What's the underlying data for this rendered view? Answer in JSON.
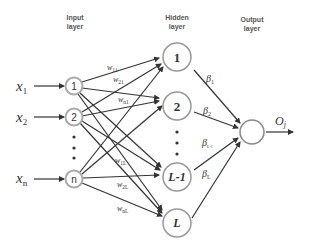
{
  "labels": {
    "input_layer": [
      "Input",
      "layer"
    ],
    "hidden_layer": [
      "Hidden",
      "layer"
    ],
    "output_layer": [
      "Output",
      "layer"
    ]
  },
  "inputs": [
    {
      "var": "x",
      "sub": "1",
      "node": "1"
    },
    {
      "var": "x",
      "sub": "2",
      "node": "2"
    },
    {
      "var": "x",
      "sub": "n",
      "node": "n"
    }
  ],
  "hidden": [
    "1",
    "2",
    "L-1",
    "L"
  ],
  "weights": [
    {
      "w": "w",
      "sub": "11"
    },
    {
      "w": "w",
      "sub": "21"
    },
    {
      "w": "w",
      "sub": "n1"
    },
    {
      "w": "w",
      "sub": "1L"
    },
    {
      "w": "w",
      "sub": "2L"
    },
    {
      "w": "w",
      "sub": "nL"
    }
  ],
  "betas": [
    {
      "b": "β",
      "sub": "1"
    },
    {
      "b": "β",
      "sub": "2"
    },
    {
      "b": "β",
      "sub": "L-1"
    },
    {
      "b": "β",
      "sub": "L"
    }
  ],
  "output": {
    "var": "O",
    "sub": "j"
  },
  "colors": {
    "input_node_stroke": "#aaaaaa",
    "hidden_node_stroke": "#999999",
    "edge": "#333333"
  }
}
